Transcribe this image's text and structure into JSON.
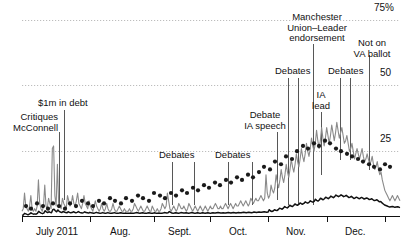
{
  "chart_data": {
    "type": "line",
    "title": "",
    "subtitle": "",
    "xlabel": "",
    "ylabel": "",
    "ylim": [
      0,
      75
    ],
    "yticks": [
      25,
      50,
      75
    ],
    "ytick_labels": [
      "25",
      "50",
      "75%"
    ],
    "grid": "horizontal dotted gridlines at 25, 50, 75",
    "legend_position": "none",
    "x": "daily, July 2011 - December 2011",
    "xtick_labels": [
      "July 2011",
      "Aug.",
      "Sept.",
      "Oct.",
      "Nov.",
      "Dec."
    ],
    "series": [
      {
        "name": "gray-volatile-line",
        "color": "#8a8a8a",
        "style": "line",
        "values": [
          2,
          3,
          9,
          4,
          3,
          2,
          4,
          8,
          3,
          2,
          3,
          2,
          4,
          14,
          5,
          3,
          2,
          4,
          12,
          4,
          3,
          7,
          5,
          3,
          26,
          27,
          8,
          4,
          20,
          5,
          4,
          3,
          7,
          5,
          4,
          3,
          8,
          6,
          4,
          5,
          8,
          5,
          4,
          6,
          9,
          5,
          4,
          3,
          5,
          8,
          5,
          4,
          3,
          6,
          4,
          3,
          2,
          4,
          6,
          4,
          3,
          2,
          3,
          5,
          3,
          2,
          3,
          5,
          3,
          2,
          2,
          3,
          5,
          3,
          2,
          2,
          3,
          4,
          3,
          2,
          2,
          3,
          2,
          2,
          2,
          3,
          2,
          2,
          3,
          5,
          4,
          3,
          2,
          3,
          4,
          3,
          2,
          2,
          3,
          4,
          3,
          2,
          2,
          4,
          3,
          2,
          2,
          3,
          2,
          2,
          3,
          5,
          4,
          3,
          4,
          9,
          6,
          3,
          2,
          3,
          4,
          3,
          2,
          3,
          5,
          4,
          3,
          3,
          4,
          3,
          2,
          3,
          5,
          4,
          3,
          2,
          3,
          4,
          3,
          2,
          3,
          4,
          3,
          2,
          3,
          4,
          3,
          2,
          3,
          4,
          3,
          3,
          4,
          5,
          4,
          3,
          3,
          4,
          3,
          3,
          4,
          5,
          4,
          3,
          4,
          5,
          4,
          3,
          4,
          5,
          4,
          4,
          5,
          6,
          5,
          4,
          5,
          6,
          5,
          4,
          5,
          7,
          6,
          5,
          6,
          7,
          6,
          6,
          7,
          8,
          7,
          6,
          7,
          16,
          9,
          7,
          8,
          12,
          10,
          9,
          11,
          16,
          13,
          11,
          14,
          18,
          15,
          13,
          16,
          20,
          17,
          15,
          18,
          22,
          19,
          17,
          20,
          24,
          21,
          19,
          22,
          26,
          23,
          21,
          24,
          28,
          25,
          23,
          26,
          30,
          27,
          25,
          28,
          33,
          29,
          26,
          29,
          34,
          30,
          27,
          30,
          34,
          31,
          28,
          31,
          35,
          32,
          29,
          32,
          36,
          33,
          30,
          32,
          34,
          31,
          28,
          29,
          31,
          28,
          25,
          26,
          28,
          25,
          22,
          24,
          26,
          24,
          22,
          24,
          26,
          23,
          21,
          22,
          24,
          22,
          20,
          21,
          23,
          20,
          18,
          19,
          21,
          18,
          16,
          17,
          14,
          12,
          10,
          9,
          8,
          7,
          6,
          7,
          8,
          7,
          6,
          7,
          8,
          7,
          6
        ]
      },
      {
        "name": "black-smooth-line",
        "color": "#111111",
        "style": "line",
        "values": [
          0.5,
          0.6,
          1.2,
          1.0,
          0.8,
          0.7,
          1.0,
          1.4,
          1.1,
          0.9,
          1.0,
          0.9,
          1.2,
          2.0,
          1.6,
          1.3,
          1.1,
          1.3,
          2.2,
          1.8,
          1.5,
          1.8,
          1.6,
          1.4,
          2.6,
          2.8,
          2.2,
          1.8,
          2.5,
          2.0,
          1.7,
          1.5,
          1.9,
          1.7,
          1.5,
          1.4,
          1.8,
          1.6,
          1.4,
          1.5,
          1.8,
          1.6,
          1.4,
          1.6,
          1.9,
          1.6,
          1.4,
          1.3,
          1.5,
          1.8,
          1.5,
          1.4,
          1.3,
          1.6,
          1.4,
          1.3,
          1.2,
          1.4,
          1.6,
          1.4,
          1.3,
          1.2,
          1.3,
          1.5,
          1.3,
          1.2,
          1.3,
          1.5,
          1.3,
          1.2,
          1.2,
          1.3,
          1.5,
          1.3,
          1.2,
          1.2,
          1.3,
          1.4,
          1.3,
          1.2,
          1.2,
          1.3,
          1.2,
          1.2,
          1.2,
          1.3,
          1.2,
          1.2,
          1.3,
          1.5,
          1.4,
          1.3,
          1.2,
          1.3,
          1.4,
          1.3,
          1.2,
          1.2,
          1.3,
          1.4,
          1.3,
          1.2,
          1.2,
          1.4,
          1.3,
          1.2,
          1.2,
          1.3,
          1.2,
          1.2,
          1.3,
          1.5,
          1.4,
          1.3,
          1.4,
          1.9,
          1.6,
          1.3,
          1.2,
          1.3,
          1.4,
          1.3,
          1.2,
          1.3,
          1.5,
          1.4,
          1.3,
          1.3,
          1.4,
          1.3,
          1.2,
          1.3,
          1.5,
          1.4,
          1.3,
          1.2,
          1.3,
          1.4,
          1.3,
          1.2,
          1.3,
          1.4,
          1.3,
          1.2,
          1.3,
          1.4,
          1.3,
          1.2,
          1.3,
          1.4,
          1.3,
          1.3,
          1.4,
          1.5,
          1.4,
          1.3,
          1.3,
          1.4,
          1.3,
          1.3,
          1.4,
          1.5,
          1.4,
          1.3,
          1.4,
          1.5,
          1.4,
          1.3,
          1.4,
          1.5,
          1.4,
          1.4,
          1.5,
          1.6,
          1.5,
          1.4,
          1.5,
          1.6,
          1.5,
          1.4,
          1.5,
          1.7,
          1.6,
          1.5,
          1.6,
          1.7,
          1.6,
          1.6,
          1.7,
          1.8,
          1.7,
          1.6,
          1.7,
          2.6,
          2.1,
          1.9,
          2.1,
          2.6,
          2.4,
          2.3,
          2.6,
          3.2,
          3.0,
          2.8,
          3.2,
          3.8,
          3.5,
          3.3,
          3.7,
          4.3,
          4.0,
          3.8,
          4.2,
          4.8,
          4.5,
          4.3,
          4.6,
          5.2,
          4.9,
          4.7,
          5.0,
          5.6,
          5.3,
          5.1,
          5.4,
          6.0,
          5.7,
          5.5,
          5.8,
          6.6,
          6.2,
          5.9,
          6.3,
          7.0,
          6.7,
          6.4,
          6.8,
          7.4,
          7.1,
          6.8,
          7.2,
          7.8,
          7.5,
          7.2,
          7.6,
          8.2,
          7.9,
          7.6,
          7.9,
          8.3,
          8.0,
          7.6,
          7.8,
          8.1,
          7.7,
          7.3,
          7.4,
          7.7,
          7.3,
          6.9,
          7.1,
          7.4,
          7.1,
          6.8,
          7.0,
          7.3,
          7.0,
          6.7,
          6.9,
          7.1,
          6.8,
          6.5,
          6.6,
          6.8,
          6.4,
          6.1,
          6.2,
          6.4,
          6.0,
          5.6,
          5.7,
          5.2,
          4.8,
          4.4,
          4.2,
          4.0,
          3.8,
          3.6,
          3.7,
          3.8,
          3.7,
          3.5,
          3.6,
          3.7,
          3.6,
          3.4
        ]
      },
      {
        "name": "scatter-poll-points",
        "color": "#1a1a1a",
        "style": "scatter",
        "points": [
          [
            26,
            4
          ],
          [
            31,
            3
          ],
          [
            37,
            5
          ],
          [
            43,
            4
          ],
          [
            48,
            3
          ],
          [
            53,
            5
          ],
          [
            59,
            4
          ],
          [
            65,
            3
          ],
          [
            70,
            5
          ],
          [
            76,
            4
          ],
          [
            82,
            6
          ],
          [
            88,
            5
          ],
          [
            93,
            4
          ],
          [
            99,
            6
          ],
          [
            104,
            5
          ],
          [
            110,
            7
          ],
          [
            115,
            6
          ],
          [
            121,
            5
          ],
          [
            126,
            7
          ],
          [
            132,
            6
          ],
          [
            138,
            8
          ],
          [
            143,
            7
          ],
          [
            149,
            6
          ],
          [
            154,
            9
          ],
          [
            160,
            8
          ],
          [
            165,
            7
          ],
          [
            171,
            9
          ],
          [
            176,
            8
          ],
          [
            182,
            10
          ],
          [
            187,
            9
          ],
          [
            193,
            11
          ],
          [
            198,
            10
          ],
          [
            204,
            12
          ],
          [
            209,
            11
          ],
          [
            215,
            13
          ],
          [
            220,
            12
          ],
          [
            226,
            14
          ],
          [
            231,
            13
          ],
          [
            237,
            15
          ],
          [
            242,
            14
          ],
          [
            248,
            16
          ],
          [
            253,
            15
          ],
          [
            259,
            17
          ],
          [
            264,
            19
          ],
          [
            270,
            18
          ],
          [
            275,
            21
          ],
          [
            281,
            20
          ],
          [
            286,
            23
          ],
          [
            292,
            22
          ],
          [
            297,
            25
          ],
          [
            303,
            27
          ],
          [
            308,
            26
          ],
          [
            314,
            28
          ],
          [
            319,
            27
          ],
          [
            325,
            29
          ],
          [
            330,
            28
          ],
          [
            336,
            26
          ],
          [
            341,
            25
          ],
          [
            347,
            24
          ],
          [
            352,
            23
          ],
          [
            358,
            22
          ],
          [
            363,
            21
          ],
          [
            369,
            20
          ],
          [
            374,
            19
          ],
          [
            380,
            18
          ],
          [
            385,
            20
          ],
          [
            390,
            19
          ]
        ]
      }
    ],
    "annotations": [
      {
        "id": "critiques-mcconnell",
        "text_lines": [
          "Critiques",
          "McConnell"
        ],
        "align": "right",
        "italic": false
      },
      {
        "id": "1m-in-debt",
        "text_lines": [
          "$1m in debt"
        ],
        "align": "center",
        "italic": false
      },
      {
        "id": "debates-sept",
        "text_lines": [
          "Debates"
        ],
        "align": "center",
        "italic": false
      },
      {
        "id": "debates-oct",
        "text_lines": [
          "Debates"
        ],
        "align": "center",
        "italic": false
      },
      {
        "id": "debate-ia-speech",
        "text_lines": [
          "Debate",
          "IA speech"
        ],
        "align": "center",
        "italic": false
      },
      {
        "id": "debates-nov",
        "text_lines": [
          "Debates"
        ],
        "align": "center",
        "italic": false
      },
      {
        "id": "manchester-endorsement",
        "text_lines": [
          "Manchester",
          "Union–Leader",
          "endorsement"
        ],
        "align": "center",
        "italic": "first-two"
      },
      {
        "id": "ia-lead",
        "text_lines": [
          "IA",
          "lead"
        ],
        "align": "center",
        "italic": false
      },
      {
        "id": "debates-dec",
        "text_lines": [
          "Debates"
        ],
        "align": "center",
        "italic": false
      },
      {
        "id": "not-on-va-ballot",
        "text_lines": [
          "Not on",
          "VA ballot"
        ],
        "align": "center",
        "italic": false
      }
    ]
  },
  "annotations": {
    "critiques_mcconnell_l1": "Critiques",
    "critiques_mcconnell_l2": "McConnell",
    "debt": "$1m in debt",
    "debates_sept": "Debates",
    "debates_oct": "Debates",
    "debate_ia_l1": "Debate",
    "debate_ia_l2": "IA speech",
    "debates_nov": "Debates",
    "manchester_l1": "Manchester",
    "manchester_l2": "Union–Leader",
    "manchester_l3": "endorsement",
    "ia_lead_l1": "IA",
    "ia_lead_l2": "lead",
    "debates_dec": "Debates",
    "va_ballot_l1": "Not on",
    "va_ballot_l2": "VA ballot"
  },
  "axes": {
    "y": {
      "t75": "75%",
      "t50": "50",
      "t25": "25"
    },
    "x": {
      "m1": "July 2011",
      "m2": "Aug.",
      "m3": "Sept.",
      "m4": "Oct.",
      "m5": "Nov.",
      "m6": "Dec."
    }
  },
  "colors": {
    "gray_line": "#8a8a8a",
    "black_line": "#111111",
    "dot": "#1a1a1a",
    "grid": "#bdbdbd",
    "axis": "#111111",
    "background": "#ffffff"
  }
}
